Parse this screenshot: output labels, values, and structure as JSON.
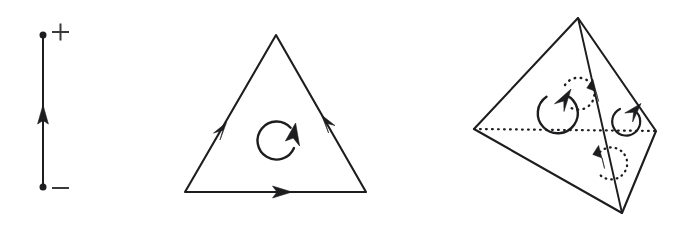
{
  "figure": {
    "title": "Oriented simplices: 1-simplex, 2-simplex, 3-simplex",
    "background_color": "#ffffff",
    "ink_color": "#1d1d1f",
    "sign_color": "#3a3a3c",
    "width": 690,
    "height": 229,
    "panels": [
      {
        "id": "panel-1-simplex",
        "name": "oriented-edge",
        "label": "1-simplex",
        "vertex_signs": {
          "top": "+",
          "bottom": "−"
        },
        "orientation": "upward",
        "geometry": {
          "segment": {
            "x": 43,
            "y_top": 35,
            "y_bottom": 187
          },
          "dot_radius": 3.4,
          "arrow_at_y": 118,
          "plus_sign": {
            "x": 60,
            "y": 32,
            "size": 17
          },
          "minus_sign": {
            "x": 60,
            "y": 188,
            "size": 17
          }
        }
      },
      {
        "id": "panel-2-simplex",
        "name": "oriented-triangle",
        "label": "2-simplex",
        "orientation": "clockwise",
        "geometry": {
          "vertices": [
            {
              "name": "apex",
              "x": 276,
              "y": 35
            },
            {
              "name": "bottom-right",
              "x": 366,
              "y": 192
            },
            {
              "name": "bottom-left",
              "x": 185,
              "y": 192
            }
          ],
          "edge_arrows": [
            {
              "edge": "apex-to-bottom-left",
              "t": 0.56,
              "direction": "down-left"
            },
            {
              "edge": "bottom-left-to-bottom-right",
              "t": 0.56,
              "direction": "right"
            },
            {
              "edge": "bottom-right-to-apex",
              "t": 0.56,
              "direction": "up-left"
            }
          ],
          "rotation_arc": {
            "cx": 277,
            "cy": 140,
            "r": 19,
            "style": "solid",
            "gap_deg": 52,
            "head": "up-right"
          }
        }
      },
      {
        "id": "panel-3-simplex",
        "name": "oriented-tetrahedron",
        "label": "3-simplex",
        "orientation": "induced-boundary",
        "geometry": {
          "vertices": [
            {
              "name": "top",
              "x": 578,
              "y": 18
            },
            {
              "name": "left",
              "x": 474,
              "y": 129
            },
            {
              "name": "right",
              "x": 656,
              "y": 131
            },
            {
              "name": "bottom",
              "x": 622,
              "y": 213
            }
          ],
          "hidden_edge": {
            "from": "left",
            "to": "right",
            "style": "dotted"
          },
          "front_edge_arrows": [
            {
              "edge": "top-to-bottom",
              "t": 0.36,
              "direction": "down"
            },
            {
              "edge": "top-to-bottom",
              "t": 0.72,
              "direction": "down"
            }
          ],
          "rotation_arcs": [
            {
              "name": "front-left-face",
              "cx": 557,
              "cy": 113,
              "r": 20,
              "style": "solid",
              "head": "up-right"
            },
            {
              "name": "back-top-face",
              "cx": 578,
              "cy": 94,
              "r": 16,
              "style": "dotted",
              "head": "none"
            },
            {
              "name": "right-face",
              "cx": 627,
              "cy": 120,
              "r": 14,
              "style": "solid",
              "head": "up-right"
            },
            {
              "name": "bottom-face",
              "cx": 586,
              "cy": 162,
              "r": 16,
              "style": "dotted",
              "head": "none"
            }
          ]
        }
      }
    ]
  }
}
